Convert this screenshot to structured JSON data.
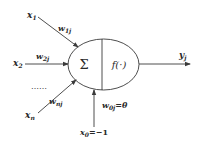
{
  "diagram": {
    "type": "neuron-model",
    "colors": {
      "stroke": "#3a3a3a",
      "text": "#2a2a2a",
      "background": "#ffffff"
    },
    "inputs": [
      {
        "id": "x1",
        "label": "x",
        "sub": "1",
        "weight": "w",
        "weight_sub": "1j"
      },
      {
        "id": "x2",
        "label": "x",
        "sub": "2",
        "weight": "w",
        "weight_sub": "2j"
      },
      {
        "id": "xn",
        "label": "x",
        "sub": "n",
        "weight": "w",
        "weight_sub": "nj"
      }
    ],
    "ellipsis": "……",
    "neuron": {
      "sum_symbol": "Σ",
      "activation": "f(·)"
    },
    "output": {
      "label": "y",
      "sub": "j"
    },
    "bias": {
      "input_label": "x",
      "input_sub": "0",
      "input_value": "=−1",
      "weight_label": "w",
      "weight_sub": "0j",
      "weight_value": "=θ"
    }
  }
}
